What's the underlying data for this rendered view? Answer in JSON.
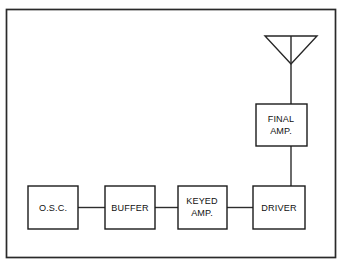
{
  "diagram": {
    "frame": {
      "name": "diagram-border",
      "stroke_color": "#2a2a2a"
    },
    "colors": {
      "background": "#ffffff",
      "line": "#2d2d2d",
      "box_stroke": "#1b1b1b",
      "text": "#111111"
    },
    "blocks": [
      {
        "id": "osc",
        "label": "O.S.C.",
        "lines": [
          "O.S.C."
        ],
        "x": 28,
        "y": 186,
        "w": 50,
        "h": 43,
        "align": "center"
      },
      {
        "id": "buffer",
        "label": "BUFFER",
        "lines": [
          "BUFFER"
        ],
        "x": 105,
        "y": 186,
        "w": 50,
        "h": 43,
        "align": "center"
      },
      {
        "id": "keyed-amp",
        "label": "KEYED AMP.",
        "lines": [
          "KEYED",
          "AMP."
        ],
        "x": 178,
        "y": 186,
        "w": 49,
        "h": 43,
        "align": "center"
      },
      {
        "id": "driver",
        "label": "DRIVER",
        "lines": [
          "DRIVER"
        ],
        "x": 253,
        "y": 186,
        "w": 52,
        "h": 43,
        "align": "center"
      },
      {
        "id": "final-amp",
        "label": "FINAL AMP.",
        "lines": [
          "FINAL",
          "AMP."
        ],
        "x": 256,
        "y": 104,
        "w": 51,
        "h": 42,
        "align": "center"
      }
    ],
    "antenna": {
      "id": "antenna",
      "label": "antenna",
      "top_bar_y": 36,
      "left_x": 265,
      "right_x": 317,
      "apex_x": 291,
      "apex_y": 64,
      "mast_bottom_y": 104
    },
    "connections": [
      {
        "id": "osc-to-buffer",
        "from": "osc",
        "to": "buffer",
        "orientation": "horizontal"
      },
      {
        "id": "buffer-to-keyed-amp",
        "from": "buffer",
        "to": "keyed-amp",
        "orientation": "horizontal"
      },
      {
        "id": "keyed-amp-to-driver",
        "from": "keyed-amp",
        "to": "driver",
        "orientation": "horizontal"
      },
      {
        "id": "driver-to-final-amp",
        "from": "driver",
        "to": "final-amp",
        "orientation": "vertical"
      },
      {
        "id": "final-amp-to-antenna",
        "from": "final-amp",
        "to": "antenna",
        "orientation": "vertical"
      }
    ]
  }
}
